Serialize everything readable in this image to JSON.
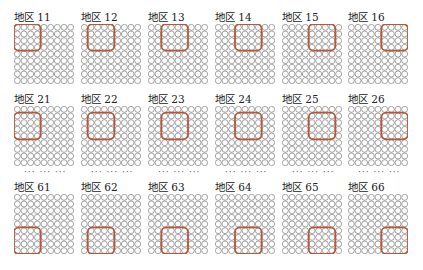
{
  "layout": {
    "grid_size": 9,
    "box_size": 4,
    "column_x": [
      14,
      81,
      148,
      215,
      282,
      348
    ],
    "row_y": [
      11,
      93,
      181
    ],
    "ellipsis_y": 167,
    "circle_color": "#6a6a6a",
    "box_color": "#b5593a"
  },
  "ellipsis_text": "··· ··· ···",
  "rows": [
    {
      "box_row": 0,
      "panels": [
        {
          "label": "地区 11",
          "box_col": 0
        },
        {
          "label": "地区 12",
          "box_col": 1
        },
        {
          "label": "地区 13",
          "box_col": 2
        },
        {
          "label": "地区 14",
          "box_col": 3
        },
        {
          "label": "地区 15",
          "box_col": 4
        },
        {
          "label": "地区 16",
          "box_col": 5
        }
      ]
    },
    {
      "box_row": 1,
      "panels": [
        {
          "label": "地区 21",
          "box_col": 0
        },
        {
          "label": "地区 22",
          "box_col": 1
        },
        {
          "label": "地区 23",
          "box_col": 2
        },
        {
          "label": "地区 24",
          "box_col": 3
        },
        {
          "label": "地区 25",
          "box_col": 4
        },
        {
          "label": "地区 26",
          "box_col": 5
        }
      ]
    },
    {
      "box_row": 5,
      "panels": [
        {
          "label": "地区 61",
          "box_col": 0
        },
        {
          "label": "地区 62",
          "box_col": 1
        },
        {
          "label": "地区 63",
          "box_col": 2
        },
        {
          "label": "地区 64",
          "box_col": 3
        },
        {
          "label": "地区 65",
          "box_col": 4
        },
        {
          "label": "地区 66",
          "box_col": 5
        }
      ]
    }
  ]
}
